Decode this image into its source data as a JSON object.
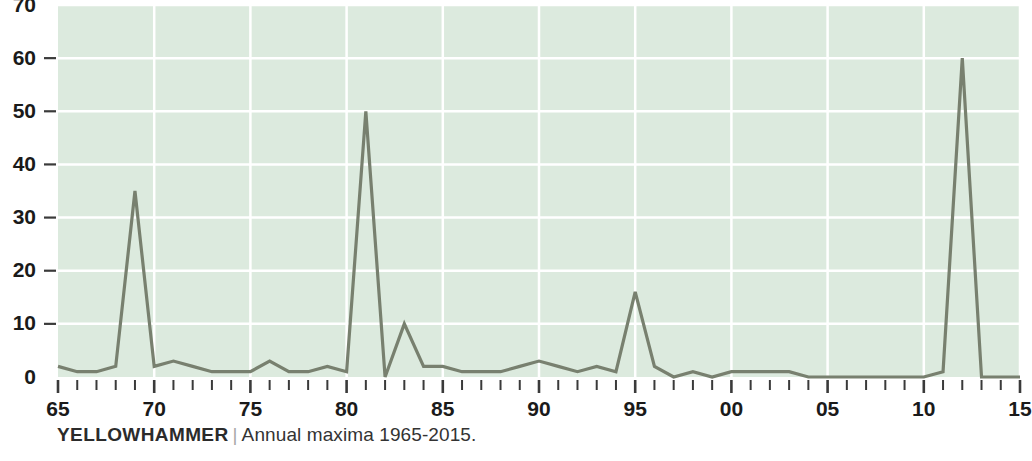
{
  "caption": {
    "series_name": "YELLOWHAMMER",
    "separator": "|",
    "subtitle": "Annual maxima 1965-2015."
  },
  "colors": {
    "plot_background": "#dceade",
    "gridline": "#ffffff",
    "line": "#78806f",
    "text": "#1a1a1a",
    "page_background": "#ffffff"
  },
  "chart_data": {
    "type": "line",
    "xlabel": "",
    "ylabel": "",
    "grid": true,
    "legend": "none",
    "xlim": [
      1965,
      2015
    ],
    "ylim": [
      0,
      70
    ],
    "ytick_values": [
      0,
      10,
      20,
      30,
      40,
      50,
      60,
      70
    ],
    "ytick_labels": [
      "0",
      "10",
      "20",
      "30",
      "40",
      "50",
      "60",
      "70"
    ],
    "xtick_values": [
      1965,
      1970,
      1975,
      1980,
      1985,
      1990,
      1995,
      2000,
      2005,
      2010,
      2015
    ],
    "xtick_labels": [
      "65",
      "70",
      "75",
      "80",
      "85",
      "90",
      "95",
      "00",
      "05",
      "10",
      "15"
    ],
    "x_minor_tick_interval": 1,
    "series": [
      {
        "name": "Annual maxima",
        "color": "#78806f",
        "x": [
          1965,
          1966,
          1967,
          1968,
          1969,
          1970,
          1971,
          1972,
          1973,
          1974,
          1975,
          1976,
          1977,
          1978,
          1979,
          1980,
          1981,
          1982,
          1983,
          1984,
          1985,
          1986,
          1987,
          1988,
          1989,
          1990,
          1991,
          1992,
          1993,
          1994,
          1995,
          1996,
          1997,
          1998,
          1999,
          2000,
          2001,
          2002,
          2003,
          2004,
          2005,
          2006,
          2007,
          2008,
          2009,
          2010,
          2011,
          2012,
          2013,
          2014,
          2015
        ],
        "values": [
          2,
          1,
          1,
          2,
          35,
          2,
          3,
          2,
          1,
          1,
          1,
          3,
          1,
          1,
          2,
          1,
          50,
          0,
          10,
          2,
          2,
          1,
          1,
          1,
          2,
          3,
          2,
          1,
          2,
          1,
          16,
          2,
          0,
          1,
          0,
          1,
          1,
          1,
          1,
          0,
          0,
          0,
          0,
          0,
          0,
          0,
          1,
          60,
          0,
          0,
          0
        ]
      }
    ]
  }
}
